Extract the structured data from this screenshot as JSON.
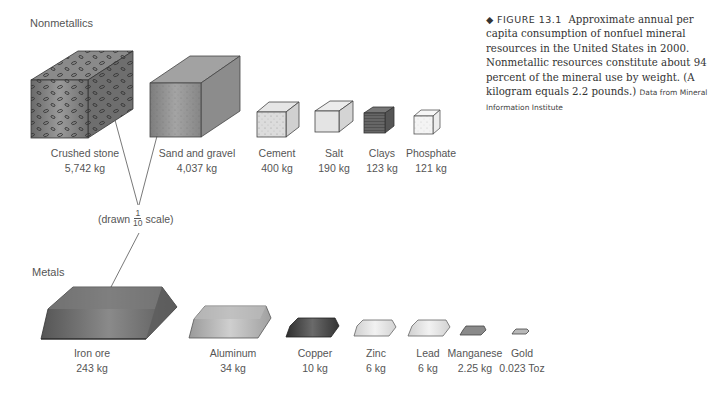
{
  "sections": {
    "nonmetallics": "Nonmetallics",
    "metals": "Metals"
  },
  "scale_note": {
    "prefix": "(drawn",
    "fraction_numerator": "1",
    "fraction_denominator": "10",
    "suffix": "scale)"
  },
  "nonmetallics": [
    {
      "name": "Crushed stone",
      "amount": "5,742 kg"
    },
    {
      "name": "Sand and gravel",
      "amount": "4,037 kg"
    },
    {
      "name": "Cement",
      "amount": "400 kg"
    },
    {
      "name": "Salt",
      "amount": "190 kg"
    },
    {
      "name": "Clays",
      "amount": "123 kg"
    },
    {
      "name": "Phosphate",
      "amount": "121 kg"
    }
  ],
  "metals": [
    {
      "name": "Iron ore",
      "amount": "243 kg"
    },
    {
      "name": "Aluminum",
      "amount": "34 kg"
    },
    {
      "name": "Copper",
      "amount": "10 kg"
    },
    {
      "name": "Zinc",
      "amount": "6 kg"
    },
    {
      "name": "Lead",
      "amount": "6 kg"
    },
    {
      "name": "Manganese",
      "amount": "2.25 kg"
    },
    {
      "name": "Gold",
      "amount": "0.023 Toz"
    }
  ],
  "caption": {
    "bullet": "◆",
    "figure_label": "FIGURE 13.1",
    "text": "Approximate annual per capita consumption of nonfuel mineral resources in the United States in 2000. Nonmetallic resources constitute about 94 percent of the mineral use by weight. (A kilogram equals 2.2 pounds.)",
    "source": "Data from Mineral Information Institute"
  },
  "colors": {
    "crushed_stone": "#7a7a7a",
    "sand_gravel": "#8c8c8c",
    "cement": "#d8d8d8",
    "salt": "#e2e2e2",
    "clays": "#5e5e5e",
    "phosphate": "#f2f2f2",
    "iron_ore": "#666666",
    "aluminum": "#a8a8a8",
    "copper": "#444444",
    "zinc": "#dcdcdc",
    "lead": "#d2d2d2",
    "manganese": "#8a8a8a",
    "gold": "#b8b8b8"
  }
}
